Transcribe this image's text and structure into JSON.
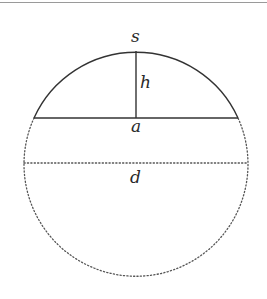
{
  "figure": {
    "type": "circular-segment-diagram",
    "labels": {
      "arc": "s",
      "height": "h",
      "chord": "a",
      "diameter": "d"
    },
    "colors": {
      "stroke": "#333333",
      "dotted": "#555555",
      "background": "#ffffff"
    },
    "geometry": {
      "center": [
        136,
        163
      ],
      "radius": 112,
      "chord_y": 118,
      "chord_x": [
        34,
        238
      ],
      "height_line_x": 136,
      "diameter_y": 163
    }
  }
}
